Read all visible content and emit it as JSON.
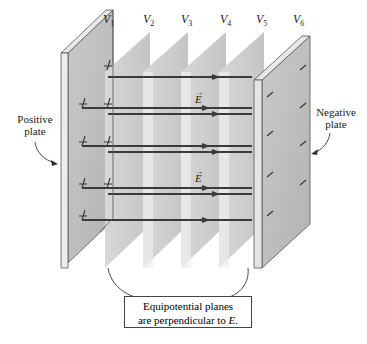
{
  "figure": {
    "type": "physics-diagram",
    "colors": {
      "plate_face": "#bdbdbd",
      "plate_edge": "#e6e6e6",
      "plane_fill": "#cfcfcf",
      "field_line": "#3a3a3a",
      "text": "#222222"
    }
  },
  "potential_labels": [
    {
      "symbol": "V",
      "sub": "1"
    },
    {
      "symbol": "V",
      "sub": "2"
    },
    {
      "symbol": "V",
      "sub": "3"
    },
    {
      "symbol": "V",
      "sub": "4"
    },
    {
      "symbol": "V",
      "sub": "5"
    },
    {
      "symbol": "V",
      "sub": "6"
    }
  ],
  "plates": {
    "positive": {
      "label_line1": "Positive",
      "label_line2": "plate",
      "charge_symbol": "+"
    },
    "negative": {
      "label_line1": "Negative",
      "label_line2": "plate",
      "charge_symbol": "−"
    }
  },
  "field_labels": [
    {
      "symbol": "E",
      "vector_mark": "→"
    },
    {
      "symbol": "E",
      "vector_mark": "→"
    }
  ],
  "caption": {
    "line1": "Equipotential planes",
    "line2_prefix": "are perpendicular to ",
    "line2_symbol": "E",
    "line2_suffix": "."
  }
}
